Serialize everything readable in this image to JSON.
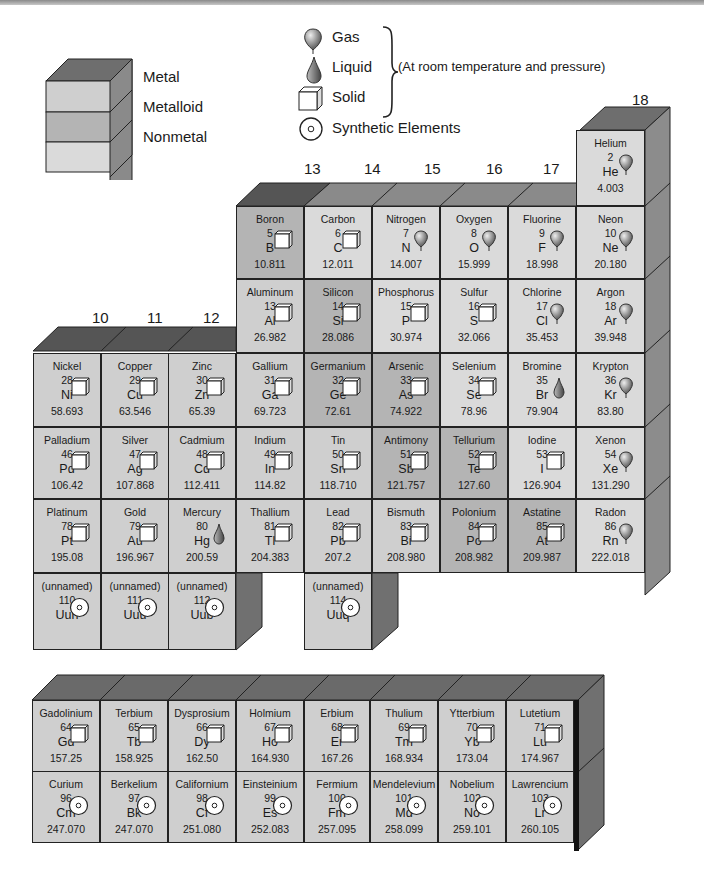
{
  "legend": {
    "categories": [
      {
        "label": "Metal",
        "color": "#cfcfcf"
      },
      {
        "label": "Metalloid",
        "color": "#b4b4b4"
      },
      {
        "label": "Nonmetal",
        "color": "#dadada"
      }
    ],
    "states": [
      {
        "label": "Gas",
        "icon": "balloon-icon"
      },
      {
        "label": "Liquid",
        "icon": "droplet-icon"
      },
      {
        "label": "Solid",
        "icon": "cube-icon"
      },
      {
        "label": "Synthetic Elements",
        "icon": "synthetic-circle-icon"
      }
    ],
    "note": "(At room temperature and pressure)"
  },
  "groups": {
    "g10": "10",
    "g11": "11",
    "g12": "12",
    "g13": "13",
    "g14": "14",
    "g15": "15",
    "g16": "16",
    "g17": "17",
    "g18": "18"
  },
  "main_table": [
    {
      "name": "Helium",
      "num": "2",
      "sym": "He",
      "wt": "4.003",
      "state": "gas",
      "cat": "nonmetal"
    },
    {
      "name": "Boron",
      "num": "5",
      "sym": "B",
      "wt": "10.811",
      "state": "solid",
      "cat": "metalloid"
    },
    {
      "name": "Carbon",
      "num": "6",
      "sym": "C",
      "wt": "12.011",
      "state": "solid",
      "cat": "nonmetal"
    },
    {
      "name": "Nitrogen",
      "num": "7",
      "sym": "N",
      "wt": "14.007",
      "state": "gas",
      "cat": "nonmetal"
    },
    {
      "name": "Oxygen",
      "num": "8",
      "sym": "O",
      "wt": "15.999",
      "state": "gas",
      "cat": "nonmetal"
    },
    {
      "name": "Fluorine",
      "num": "9",
      "sym": "F",
      "wt": "18.998",
      "state": "gas",
      "cat": "nonmetal"
    },
    {
      "name": "Neon",
      "num": "10",
      "sym": "Ne",
      "wt": "20.180",
      "state": "gas",
      "cat": "nonmetal"
    },
    {
      "name": "Aluminum",
      "num": "13",
      "sym": "Al",
      "wt": "26.982",
      "state": "solid",
      "cat": "metal"
    },
    {
      "name": "Silicon",
      "num": "14",
      "sym": "Si",
      "wt": "28.086",
      "state": "solid",
      "cat": "metalloid"
    },
    {
      "name": "Phosphorus",
      "num": "15",
      "sym": "P",
      "wt": "30.974",
      "state": "solid",
      "cat": "nonmetal"
    },
    {
      "name": "Sulfur",
      "num": "16",
      "sym": "S",
      "wt": "32.066",
      "state": "solid",
      "cat": "nonmetal"
    },
    {
      "name": "Chlorine",
      "num": "17",
      "sym": "Cl",
      "wt": "35.453",
      "state": "gas",
      "cat": "nonmetal"
    },
    {
      "name": "Argon",
      "num": "18",
      "sym": "Ar",
      "wt": "39.948",
      "state": "gas",
      "cat": "nonmetal"
    },
    {
      "name": "Nickel",
      "num": "28",
      "sym": "Ni",
      "wt": "58.693",
      "state": "solid",
      "cat": "metal"
    },
    {
      "name": "Copper",
      "num": "29",
      "sym": "Cu",
      "wt": "63.546",
      "state": "solid",
      "cat": "metal"
    },
    {
      "name": "Zinc",
      "num": "30",
      "sym": "Zn",
      "wt": "65.39",
      "state": "solid",
      "cat": "metal"
    },
    {
      "name": "Gallium",
      "num": "31",
      "sym": "Ga",
      "wt": "69.723",
      "state": "solid",
      "cat": "metal"
    },
    {
      "name": "Germanium",
      "num": "32",
      "sym": "Ge",
      "wt": "72.61",
      "state": "solid",
      "cat": "metalloid"
    },
    {
      "name": "Arsenic",
      "num": "33",
      "sym": "As",
      "wt": "74.922",
      "state": "solid",
      "cat": "metalloid"
    },
    {
      "name": "Selenium",
      "num": "34",
      "sym": "Se",
      "wt": "78.96",
      "state": "solid",
      "cat": "nonmetal"
    },
    {
      "name": "Bromine",
      "num": "35",
      "sym": "Br",
      "wt": "79.904",
      "state": "liquid",
      "cat": "nonmetal"
    },
    {
      "name": "Krypton",
      "num": "36",
      "sym": "Kr",
      "wt": "83.80",
      "state": "gas",
      "cat": "nonmetal"
    },
    {
      "name": "Palladium",
      "num": "46",
      "sym": "Pd",
      "wt": "106.42",
      "state": "solid",
      "cat": "metal"
    },
    {
      "name": "Silver",
      "num": "47",
      "sym": "Ag",
      "wt": "107.868",
      "state": "solid",
      "cat": "metal"
    },
    {
      "name": "Cadmium",
      "num": "48",
      "sym": "Cd",
      "wt": "112.411",
      "state": "solid",
      "cat": "metal"
    },
    {
      "name": "Indium",
      "num": "49",
      "sym": "In",
      "wt": "114.82",
      "state": "solid",
      "cat": "metal"
    },
    {
      "name": "Tin",
      "num": "50",
      "sym": "Sn",
      "wt": "118.710",
      "state": "solid",
      "cat": "metal"
    },
    {
      "name": "Antimony",
      "num": "51",
      "sym": "Sb",
      "wt": "121.757",
      "state": "solid",
      "cat": "metalloid"
    },
    {
      "name": "Tellurium",
      "num": "52",
      "sym": "Te",
      "wt": "127.60",
      "state": "solid",
      "cat": "metalloid"
    },
    {
      "name": "Iodine",
      "num": "53",
      "sym": "I",
      "wt": "126.904",
      "state": "solid",
      "cat": "nonmetal"
    },
    {
      "name": "Xenon",
      "num": "54",
      "sym": "Xe",
      "wt": "131.290",
      "state": "gas",
      "cat": "nonmetal"
    },
    {
      "name": "Platinum",
      "num": "78",
      "sym": "Pt",
      "wt": "195.08",
      "state": "solid",
      "cat": "metal"
    },
    {
      "name": "Gold",
      "num": "79",
      "sym": "Au",
      "wt": "196.967",
      "state": "solid",
      "cat": "metal"
    },
    {
      "name": "Mercury",
      "num": "80",
      "sym": "Hg",
      "wt": "200.59",
      "state": "liquid",
      "cat": "metal"
    },
    {
      "name": "Thallium",
      "num": "81",
      "sym": "Tl",
      "wt": "204.383",
      "state": "solid",
      "cat": "metal"
    },
    {
      "name": "Lead",
      "num": "82",
      "sym": "Pb",
      "wt": "207.2",
      "state": "solid",
      "cat": "metal"
    },
    {
      "name": "Bismuth",
      "num": "83",
      "sym": "Bi",
      "wt": "208.980",
      "state": "solid",
      "cat": "metal"
    },
    {
      "name": "Polonium",
      "num": "84",
      "sym": "Po",
      "wt": "208.982",
      "state": "solid",
      "cat": "metalloid"
    },
    {
      "name": "Astatine",
      "num": "85",
      "sym": "At",
      "wt": "209.987",
      "state": "solid",
      "cat": "metalloid"
    },
    {
      "name": "Radon",
      "num": "86",
      "sym": "Rn",
      "wt": "222.018",
      "state": "gas",
      "cat": "nonmetal"
    },
    {
      "name": "(unnamed)",
      "num": "110",
      "sym": "Uun",
      "wt": "",
      "state": "synthetic",
      "cat": "metal"
    },
    {
      "name": "(unnamed)",
      "num": "111",
      "sym": "Uuu",
      "wt": "",
      "state": "synthetic",
      "cat": "metal"
    },
    {
      "name": "(unnamed)",
      "num": "112",
      "sym": "Uub",
      "wt": "",
      "state": "synthetic",
      "cat": "metal"
    },
    {
      "name": "(unnamed)",
      "num": "114",
      "sym": "Uuq",
      "wt": "",
      "state": "synthetic",
      "cat": "metal"
    }
  ],
  "bottom_table": [
    {
      "name": "Gadolinium",
      "num": "64",
      "sym": "Gd",
      "wt": "157.25",
      "state": "solid"
    },
    {
      "name": "Terbium",
      "num": "65",
      "sym": "Tb",
      "wt": "158.925",
      "state": "solid"
    },
    {
      "name": "Dysprosium",
      "num": "66",
      "sym": "Dy",
      "wt": "162.50",
      "state": "solid"
    },
    {
      "name": "Holmium",
      "num": "67",
      "sym": "Ho",
      "wt": "164.930",
      "state": "solid"
    },
    {
      "name": "Erbium",
      "num": "68",
      "sym": "Er",
      "wt": "167.26",
      "state": "solid"
    },
    {
      "name": "Thulium",
      "num": "69",
      "sym": "Tm",
      "wt": "168.934",
      "state": "solid"
    },
    {
      "name": "Ytterbium",
      "num": "70",
      "sym": "Yb",
      "wt": "173.04",
      "state": "solid"
    },
    {
      "name": "Lutetium",
      "num": "71",
      "sym": "Lu",
      "wt": "174.967",
      "state": "solid"
    },
    {
      "name": "Curium",
      "num": "96",
      "sym": "Cm",
      "wt": "247.070",
      "state": "synthetic"
    },
    {
      "name": "Berkelium",
      "num": "97",
      "sym": "Bk",
      "wt": "247.070",
      "state": "synthetic"
    },
    {
      "name": "Californium",
      "num": "98",
      "sym": "Cf",
      "wt": "251.080",
      "state": "synthetic"
    },
    {
      "name": "Einsteinium",
      "num": "99",
      "sym": "Es",
      "wt": "252.083",
      "state": "synthetic"
    },
    {
      "name": "Fermium",
      "num": "100",
      "sym": "Fm",
      "wt": "257.095",
      "state": "synthetic"
    },
    {
      "name": "Mendelevium",
      "num": "101",
      "sym": "Md",
      "wt": "258.099",
      "state": "synthetic"
    },
    {
      "name": "Nobelium",
      "num": "102",
      "sym": "No",
      "wt": "259.101",
      "state": "synthetic"
    },
    {
      "name": "Lawrencium",
      "num": "103",
      "sym": "Lr",
      "wt": "260.105",
      "state": "synthetic"
    }
  ]
}
